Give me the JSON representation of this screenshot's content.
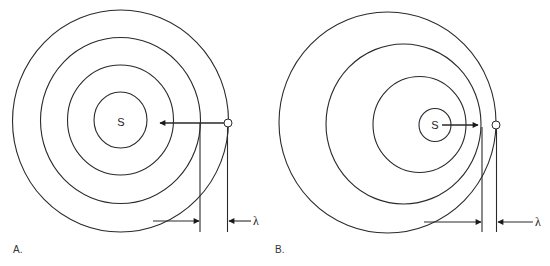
{
  "panels": [
    {
      "id": "A",
      "label": "A.",
      "source_label": "S",
      "wavelength_label": "λ",
      "description": "Stationary source: concentric wavefronts, observer at outer wavefront"
    },
    {
      "id": "B",
      "label": "B.",
      "source_label": "S",
      "wavelength_label": "λ",
      "description": "Moving source toward observer: compressed wavefronts, shorter wavelength"
    }
  ]
}
